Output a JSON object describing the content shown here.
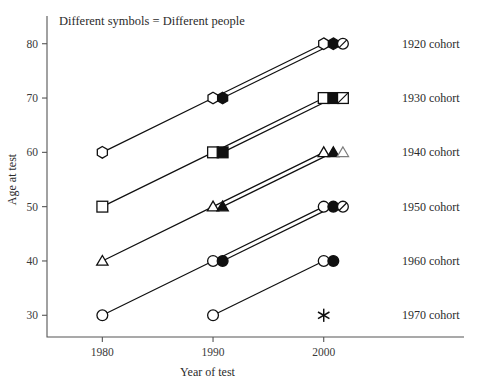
{
  "chart_data": {
    "type": "scatter",
    "title": "",
    "annotation": "Different symbols = Different people",
    "xlabel": "Year of test",
    "ylabel": "Age at test",
    "x_ticks": [
      "1980",
      "1990",
      "2000"
    ],
    "x_tick_values": [
      1980,
      1990,
      2000
    ],
    "y_ticks": [
      "30",
      "40",
      "50",
      "60",
      "70",
      "80"
    ],
    "y_tick_values": [
      30,
      40,
      50,
      60,
      70,
      80
    ],
    "xlim": [
      1975,
      2004
    ],
    "ylim": [
      26,
      84
    ],
    "grid": false,
    "legend_position": "right",
    "accent_color": "#101010",
    "ghost_color": "#7d7d7d",
    "cohorts": [
      {
        "label": "1920 cohort",
        "birth_year": 1920,
        "label_y": 80,
        "series": [
          {
            "person": "person-a",
            "symbol": "hexagon-open",
            "points": [
              {
                "x": 1980,
                "y": 60
              },
              {
                "x": 1990,
                "y": 70
              },
              {
                "x": 2000,
                "y": 80
              }
            ]
          },
          {
            "person": "person-b",
            "symbol": "hexagon-filled",
            "points": [
              {
                "x": 1990,
                "y": 70
              },
              {
                "x": 2000,
                "y": 80
              }
            ]
          },
          {
            "person": "person-c",
            "symbol": "circle-slash",
            "points": [
              {
                "x": 2000,
                "y": 80
              }
            ]
          }
        ]
      },
      {
        "label": "1930 cohort",
        "birth_year": 1930,
        "label_y": 70,
        "series": [
          {
            "person": "person-a",
            "symbol": "square-open",
            "points": [
              {
                "x": 1980,
                "y": 50
              },
              {
                "x": 1990,
                "y": 60
              },
              {
                "x": 2000,
                "y": 70
              }
            ]
          },
          {
            "person": "person-b",
            "symbol": "square-filled",
            "points": [
              {
                "x": 1990,
                "y": 60
              },
              {
                "x": 2000,
                "y": 70
              }
            ]
          },
          {
            "person": "person-c",
            "symbol": "square-slash",
            "points": [
              {
                "x": 2000,
                "y": 70
              }
            ]
          }
        ]
      },
      {
        "label": "1940 cohort",
        "birth_year": 1940,
        "label_y": 60,
        "series": [
          {
            "person": "person-a",
            "symbol": "triangle-open",
            "points": [
              {
                "x": 1980,
                "y": 40
              },
              {
                "x": 1990,
                "y": 50
              },
              {
                "x": 2000,
                "y": 60
              }
            ]
          },
          {
            "person": "person-b",
            "symbol": "triangle-filled",
            "points": [
              {
                "x": 1990,
                "y": 50
              },
              {
                "x": 2000,
                "y": 60
              }
            ]
          },
          {
            "person": "person-c",
            "symbol": "triangle-ghost",
            "points": [
              {
                "x": 2000,
                "y": 60
              }
            ]
          }
        ]
      },
      {
        "label": "1950 cohort",
        "birth_year": 1950,
        "label_y": 50,
        "series": [
          {
            "person": "person-a",
            "symbol": "circle-open",
            "points": [
              {
                "x": 1980,
                "y": 30
              },
              {
                "x": 1990,
                "y": 40
              },
              {
                "x": 2000,
                "y": 50
              }
            ]
          },
          {
            "person": "person-b",
            "symbol": "circle-filled",
            "points": [
              {
                "x": 1990,
                "y": 40
              },
              {
                "x": 2000,
                "y": 50
              }
            ]
          },
          {
            "person": "person-c",
            "symbol": "circle-slash",
            "points": [
              {
                "x": 2000,
                "y": 50
              }
            ]
          }
        ]
      },
      {
        "label": "1960 cohort",
        "birth_year": 1960,
        "label_y": 40,
        "series": [
          {
            "person": "person-a",
            "symbol": "circle-open",
            "points": [
              {
                "x": 1990,
                "y": 30
              },
              {
                "x": 2000,
                "y": 40
              }
            ]
          },
          {
            "person": "person-b",
            "symbol": "circle-filled",
            "points": [
              {
                "x": 2000,
                "y": 40
              }
            ]
          }
        ]
      },
      {
        "label": "1970 cohort",
        "birth_year": 1970,
        "label_y": 30,
        "series": [
          {
            "person": "person-a",
            "symbol": "star",
            "points": [
              {
                "x": 2000,
                "y": 30
              }
            ]
          }
        ]
      }
    ]
  }
}
